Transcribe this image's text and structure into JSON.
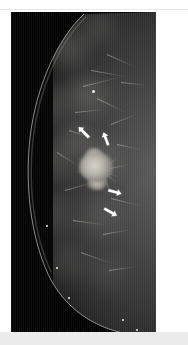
{
  "figure": {
    "modality": "mammography",
    "view_label": "",
    "caption": "",
    "panel_background": "#000000",
    "page_background": "#ffffff",
    "accent_marker_color": "#ffffff"
  },
  "panel": {
    "name": "mammogram-image",
    "x": 11,
    "y": 12,
    "width": 145,
    "height": 320
  },
  "findings": {
    "primary": {
      "name": "spiculated-mass",
      "center_x": 90,
      "center_y": 158,
      "radius_x": 19,
      "radius_y": 16,
      "brightness": "#d8d4cc"
    },
    "secondary": {
      "name": "satellite-density",
      "center_x": 83,
      "center_y": 80,
      "radius": 4
    }
  },
  "annotations": {
    "label": "arrow-markers",
    "count": 4,
    "color": "#ffffff",
    "arrows": [
      {
        "id": "arrow-upper-left",
        "x": 74,
        "y": 126,
        "rotation": 135,
        "length": 16,
        "points_to": "mass-superior-lateral-margin"
      },
      {
        "id": "arrow-upper-right",
        "x": 93,
        "y": 134,
        "rotation": 160,
        "length": 15,
        "points_to": "mass-superior-medial-margin"
      },
      {
        "id": "arrow-lower-inner",
        "x": 92,
        "y": 178,
        "rotation": 285,
        "length": 15,
        "points_to": "mass-inferior-margin"
      },
      {
        "id": "arrow-lower-outer",
        "x": 88,
        "y": 196,
        "rotation": 300,
        "length": 16,
        "points_to": "mass-inferior-spicule"
      }
    ]
  },
  "tissue": {
    "label": "breast-parenchyma",
    "blobs": [
      {
        "x": 58,
        "y": 38,
        "w": 62,
        "h": 44,
        "color": "rgba(150,148,142,0.30)"
      },
      {
        "x": 86,
        "y": 16,
        "w": 56,
        "h": 40,
        "color": "rgba(120,118,113,0.26)"
      },
      {
        "x": 36,
        "y": 96,
        "w": 58,
        "h": 52,
        "color": "rgba(135,133,128,0.26)"
      },
      {
        "x": 76,
        "y": 86,
        "w": 66,
        "h": 50,
        "color": "rgba(155,152,146,0.28)"
      },
      {
        "x": 44,
        "y": 150,
        "w": 56,
        "h": 54,
        "color": "rgba(140,138,132,0.24)"
      },
      {
        "x": 90,
        "y": 150,
        "w": 58,
        "h": 56,
        "color": "rgba(130,128,123,0.24)"
      },
      {
        "x": 40,
        "y": 206,
        "w": 62,
        "h": 56,
        "color": "rgba(125,123,118,0.24)"
      },
      {
        "x": 88,
        "y": 208,
        "w": 60,
        "h": 58,
        "color": "rgba(115,113,109,0.22)"
      },
      {
        "x": 56,
        "y": 252,
        "w": 66,
        "h": 50,
        "color": "rgba(105,103,99,0.22)"
      },
      {
        "x": 96,
        "y": 262,
        "w": 54,
        "h": 48,
        "color": "rgba(95,93,90,0.20)"
      },
      {
        "x": 66,
        "y": 128,
        "w": 48,
        "h": 42,
        "color": "rgba(165,162,156,0.22)"
      }
    ],
    "strands": [
      {
        "x": 96,
        "y": 42,
        "len": 30,
        "rot": 24
      },
      {
        "x": 80,
        "y": 58,
        "len": 36,
        "rot": 10
      },
      {
        "x": 72,
        "y": 74,
        "len": 40,
        "rot": -14
      },
      {
        "x": 86,
        "y": 86,
        "len": 34,
        "rot": 26
      },
      {
        "x": 64,
        "y": 100,
        "len": 30,
        "rot": -6
      },
      {
        "x": 58,
        "y": 118,
        "len": 26,
        "rot": 18
      },
      {
        "x": 100,
        "y": 112,
        "len": 30,
        "rot": -22
      },
      {
        "x": 106,
        "y": 132,
        "len": 26,
        "rot": 12
      },
      {
        "x": 54,
        "y": 178,
        "len": 30,
        "rot": -16
      },
      {
        "x": 100,
        "y": 186,
        "len": 32,
        "rot": 14
      },
      {
        "x": 62,
        "y": 208,
        "len": 34,
        "rot": 8
      },
      {
        "x": 92,
        "y": 222,
        "len": 30,
        "rot": -10
      },
      {
        "x": 70,
        "y": 240,
        "len": 32,
        "rot": 20
      },
      {
        "x": 98,
        "y": 258,
        "len": 28,
        "rot": -8
      },
      {
        "x": 46,
        "y": 140,
        "len": 24,
        "rot": 32
      },
      {
        "x": 110,
        "y": 70,
        "len": 26,
        "rot": 6
      }
    ],
    "specks": [
      {
        "x": 82,
        "y": 79,
        "d": 3.0
      },
      {
        "x": 46,
        "y": 256,
        "d": 2.6
      },
      {
        "x": 58,
        "y": 286,
        "d": 2.4
      },
      {
        "x": 36,
        "y": 214,
        "d": 1.8
      },
      {
        "x": 112,
        "y": 308,
        "d": 2.0
      },
      {
        "x": 126,
        "y": 318,
        "d": 2.2
      }
    ],
    "spicules": [
      {
        "rot": 8
      },
      {
        "rot": 38
      },
      {
        "rot": 66
      },
      {
        "rot": 96
      },
      {
        "rot": 128
      },
      {
        "rot": 158
      },
      {
        "rot": 186
      },
      {
        "rot": 208
      },
      {
        "rot": 236
      },
      {
        "rot": 262
      },
      {
        "rot": 292
      },
      {
        "rot": 322
      },
      {
        "rot": 348
      },
      {
        "rot": 20
      },
      {
        "rot": 176
      },
      {
        "rot": 250
      }
    ]
  }
}
